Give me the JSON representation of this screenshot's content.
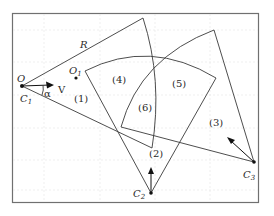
{
  "diagram": {
    "type": "geometric-sectors",
    "labels": {
      "R": "R",
      "O": "O",
      "O1": "O",
      "O1_sub": "1",
      "C1": "C",
      "C1_sub": "1",
      "C2": "C",
      "C2_sub": "2",
      "C3": "C",
      "C3_sub": "3",
      "V": "V",
      "alpha": "α"
    },
    "regions": [
      {
        "id": "1",
        "label": "(1)"
      },
      {
        "id": "2",
        "label": "(2)"
      },
      {
        "id": "3",
        "label": "(3)"
      },
      {
        "id": "4",
        "label": "(4)"
      },
      {
        "id": "5",
        "label": "(5)"
      },
      {
        "id": "6",
        "label": "(6)"
      }
    ],
    "colors": {
      "stroke": "#3a3a3a",
      "frame": "#707070",
      "grid": "#e4e4e4"
    }
  }
}
